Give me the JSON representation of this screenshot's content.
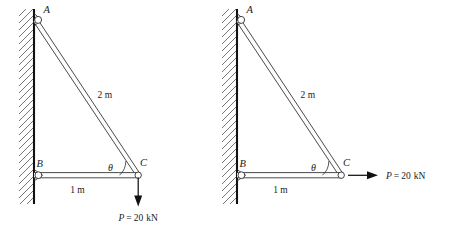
{
  "figure": {
    "type": "engineering-statics-diagram",
    "background_color": "#ffffff",
    "line_color": "#2b2b2b",
    "wall_color": "#111111",
    "hatch_color": "#555555"
  },
  "diagrams": [
    {
      "id": "left",
      "name": "diagram-left",
      "joints": [
        {
          "key": "A",
          "label": "A",
          "role": "upper-wall-pin"
        },
        {
          "key": "B",
          "label": "B",
          "role": "lower-wall-pin"
        },
        {
          "key": "C",
          "label": "C",
          "role": "free-end-pin"
        }
      ],
      "members": [
        {
          "name": "member-ac",
          "from": "A",
          "to": "C",
          "length_label": "2 m"
        },
        {
          "name": "member-bc",
          "from": "B",
          "to": "C",
          "length_label": "1 m"
        }
      ],
      "angle": {
        "symbol": "θ",
        "at_joint": "C",
        "between": [
          "member-bc",
          "member-ac"
        ]
      },
      "load": {
        "label": "P = 20 kN",
        "symbol": "P",
        "equals": "=",
        "magnitude": "20",
        "unit": "kN",
        "direction": "down",
        "applied_at": "C"
      }
    },
    {
      "id": "right",
      "name": "diagram-right",
      "joints": [
        {
          "key": "A",
          "label": "A",
          "role": "upper-wall-pin"
        },
        {
          "key": "B",
          "label": "B",
          "role": "lower-wall-pin"
        },
        {
          "key": "C",
          "label": "C",
          "role": "free-end-pin"
        }
      ],
      "members": [
        {
          "name": "member-ac",
          "from": "A",
          "to": "C",
          "length_label": "2 m"
        },
        {
          "name": "member-bc",
          "from": "B",
          "to": "C",
          "length_label": "1 m"
        }
      ],
      "angle": {
        "symbol": "θ",
        "at_joint": "C",
        "between": [
          "member-bc",
          "member-ac"
        ]
      },
      "load": {
        "label": "P = 20 kN",
        "symbol": "P",
        "equals": "=",
        "magnitude": "20",
        "unit": "kN",
        "direction": "right",
        "applied_at": "C"
      }
    }
  ]
}
